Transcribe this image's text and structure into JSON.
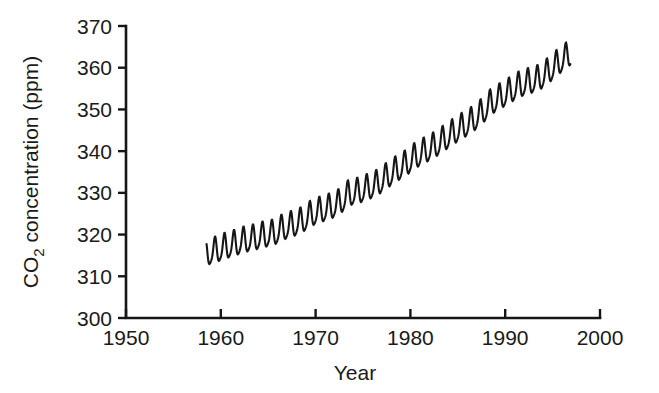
{
  "chart_data": {
    "type": "line",
    "title": "",
    "subtitle": "",
    "xlabel": "Year",
    "ylabel": "CO2 concentration (ppm)",
    "ylabel_parts": {
      "pre": "CO",
      "sub": "2",
      "post": " concentration (ppm)"
    },
    "xlim": [
      1950,
      2000
    ],
    "ylim": [
      300,
      370
    ],
    "xticks": [
      1950,
      1960,
      1970,
      1980,
      1990,
      2000
    ],
    "xtick_labels": [
      "1950",
      "1960",
      "1970",
      "1980",
      "1990",
      "2000"
    ],
    "yticks": [
      300,
      310,
      320,
      330,
      340,
      350,
      360,
      370
    ],
    "ytick_labels": [
      "300",
      "310",
      "320",
      "330",
      "340",
      "350",
      "360",
      "370"
    ],
    "grid": false,
    "legend": null,
    "annotations": [],
    "line_color": "#161616",
    "series": [
      {
        "name": "Atmospheric CO2 (monthly mean)",
        "seasonal_amplitude_ppm": 6.0,
        "seasonal_peak_month": 5,
        "seasonal_trough_month": 10,
        "x_start": 1958.5,
        "x_end": 1996.9,
        "annual_means": [
          {
            "year": 1958.5,
            "value": 315.3
          },
          {
            "year": 1959.5,
            "value": 316.0
          },
          {
            "year": 1960.5,
            "value": 316.9
          },
          {
            "year": 1961.5,
            "value": 317.6
          },
          {
            "year": 1962.5,
            "value": 318.4
          },
          {
            "year": 1963.5,
            "value": 318.9
          },
          {
            "year": 1964.5,
            "value": 319.6
          },
          {
            "year": 1965.5,
            "value": 320.0
          },
          {
            "year": 1966.5,
            "value": 321.3
          },
          {
            "year": 1967.5,
            "value": 322.1
          },
          {
            "year": 1968.5,
            "value": 323.0
          },
          {
            "year": 1969.5,
            "value": 324.6
          },
          {
            "year": 1970.5,
            "value": 325.6
          },
          {
            "year": 1971.5,
            "value": 326.3
          },
          {
            "year": 1972.5,
            "value": 327.4
          },
          {
            "year": 1973.5,
            "value": 329.6
          },
          {
            "year": 1974.5,
            "value": 330.1
          },
          {
            "year": 1975.5,
            "value": 331.0
          },
          {
            "year": 1976.5,
            "value": 332.0
          },
          {
            "year": 1977.5,
            "value": 333.7
          },
          {
            "year": 1978.5,
            "value": 335.3
          },
          {
            "year": 1979.5,
            "value": 336.7
          },
          {
            "year": 1980.5,
            "value": 338.5
          },
          {
            "year": 1981.5,
            "value": 339.8
          },
          {
            "year": 1982.5,
            "value": 341.0
          },
          {
            "year": 1983.5,
            "value": 342.6
          },
          {
            "year": 1984.5,
            "value": 344.2
          },
          {
            "year": 1985.5,
            "value": 345.7
          },
          {
            "year": 1986.5,
            "value": 347.1
          },
          {
            "year": 1987.5,
            "value": 349.0
          },
          {
            "year": 1988.5,
            "value": 351.4
          },
          {
            "year": 1989.5,
            "value": 352.8
          },
          {
            "year": 1990.5,
            "value": 354.2
          },
          {
            "year": 1991.5,
            "value": 355.6
          },
          {
            "year": 1992.5,
            "value": 356.4
          },
          {
            "year": 1993.5,
            "value": 357.1
          },
          {
            "year": 1994.5,
            "value": 358.8
          },
          {
            "year": 1995.5,
            "value": 360.8
          },
          {
            "year": 1996.5,
            "value": 362.6
          }
        ]
      }
    ]
  }
}
